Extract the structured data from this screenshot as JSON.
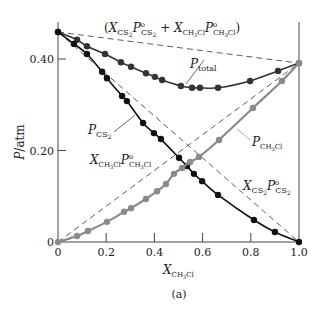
{
  "chart_data": {
    "type": "line",
    "title": "",
    "caption": "(a)",
    "xlabel": "X_CH3Cl",
    "ylabel": "P/atm",
    "xlim": [
      0,
      1.0
    ],
    "ylim": [
      0,
      0.46
    ],
    "x_ticks": [
      0,
      0.2,
      0.4,
      0.6,
      0.8,
      1.0
    ],
    "x_tick_labels": [
      "0",
      "0.2",
      "0.4",
      "0.6",
      "0.8",
      "1.0"
    ],
    "y_ticks": [
      0,
      0.2,
      0.4
    ],
    "y_tick_labels": [
      "0",
      "0.20",
      "0.40"
    ],
    "grid": false,
    "legend": "inline annotations",
    "pure_vapor_pressures": {
      "P_CS2": 0.459,
      "P_CH3Cl": 0.391
    },
    "series": [
      {
        "name": "P_total",
        "color": "#333333",
        "marker": "circle",
        "x": [
          0,
          0.079,
          0.12,
          0.195,
          0.261,
          0.303,
          0.365,
          0.402,
          0.432,
          0.51,
          0.556,
          0.589,
          0.664,
          0.797,
          0.913,
          1.0
        ],
        "y": [
          0.459,
          0.442,
          0.428,
          0.411,
          0.393,
          0.383,
          0.369,
          0.361,
          0.354,
          0.341,
          0.337,
          0.337,
          0.337,
          0.352,
          0.374,
          0.391
        ]
      },
      {
        "name": "P_CS2",
        "color": "#111111",
        "marker": "circle",
        "x": [
          0,
          0.066,
          0.12,
          0.183,
          0.203,
          0.266,
          0.286,
          0.353,
          0.398,
          0.427,
          0.502,
          0.535,
          0.564,
          0.598,
          0.664,
          0.813,
          0.9,
          1.0
        ],
        "y": [
          0.459,
          0.433,
          0.411,
          0.372,
          0.358,
          0.319,
          0.308,
          0.26,
          0.238,
          0.225,
          0.184,
          0.166,
          0.149,
          0.133,
          0.103,
          0.048,
          0.022,
          0
        ]
      },
      {
        "name": "P_CH3Cl",
        "color": "#8a8a8a",
        "marker": "circle",
        "x": [
          0,
          0.079,
          0.124,
          0.203,
          0.274,
          0.303,
          0.365,
          0.411,
          0.448,
          0.481,
          0.515,
          0.548,
          0.585,
          0.668,
          0.809,
          0.929,
          1.0
        ],
        "y": [
          0,
          0.013,
          0.024,
          0.044,
          0.066,
          0.074,
          0.094,
          0.111,
          0.127,
          0.149,
          0.162,
          0.175,
          0.186,
          0.223,
          0.293,
          0.352,
          0.391
        ]
      },
      {
        "name": "X_CS2 P°_CS2 (Raoult ideal)",
        "style": "dashed",
        "x": [
          0,
          1.0
        ],
        "y": [
          0.459,
          0
        ]
      },
      {
        "name": "X_CH3Cl P°_CH3Cl (Raoult ideal)",
        "style": "dashed",
        "x": [
          0,
          1.0
        ],
        "y": [
          0,
          0.391
        ]
      },
      {
        "name": "X_CS2 P°_CS2 + X_CH3Cl P°_CH3Cl (ideal total)",
        "style": "dashed",
        "x": [
          0,
          1.0
        ],
        "y": [
          0.459,
          0.391
        ]
      }
    ],
    "annotations": [
      "(X_CS2 P°_CS2 + X_CH3Cl P°_CH3Cl)",
      "P_total",
      "P_CS2",
      "P_CH3Cl",
      "X_CH3Cl P°_CH3Cl",
      "X_CS2 P°_CS2"
    ]
  },
  "labels": {
    "ideal_total_open": "(",
    "ideal_total_close": ")",
    "plus": " + ",
    "X": "X",
    "P": "P",
    "sub_cs2": "CS",
    "sub_2": "2",
    "sub_ch3cl_a": "CH",
    "sub_3": "3",
    "sub_ch3cl_b": "Cl",
    "sub_total": "total",
    "deg": "o",
    "ylabel_P": "P",
    "ylabel_unit": "/atm",
    "caption": "(a)"
  },
  "axes": {
    "x_ticks": [
      "0",
      "0.2",
      "0.4",
      "0.6",
      "0.8",
      "1.0"
    ],
    "y_ticks": [
      "0",
      "0.20",
      "0.40"
    ]
  }
}
